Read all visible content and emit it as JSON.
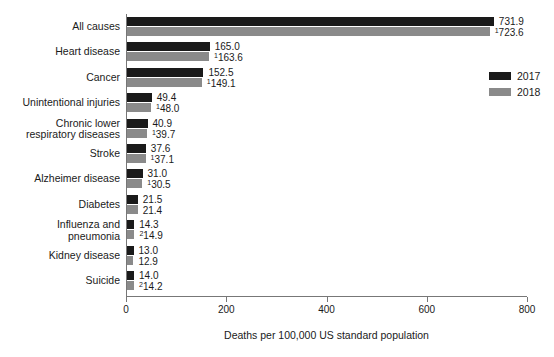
{
  "chart_data": {
    "type": "bar",
    "orientation": "horizontal",
    "title": "",
    "xlabel": "Deaths per 100,000 US standard population",
    "ylabel": "",
    "xlim": [
      0,
      800
    ],
    "xticks": [
      0,
      200,
      400,
      600,
      800
    ],
    "xtick_labels": [
      "0",
      "200",
      "400",
      "600",
      "800"
    ],
    "grid": false,
    "legend_position": "upper right",
    "categories": [
      "All causes",
      "Heart disease",
      "Cancer",
      "Unintentional injuries",
      "Chronic lower\nrespiratory diseases",
      "Stroke",
      "Alzheimer disease",
      "Diabetes",
      "Influenza and\npneumonia",
      "Kidney disease",
      "Suicide"
    ],
    "series": [
      {
        "name": "2017",
        "color": "#1a1a1a",
        "values": [
          731.9,
          165.0,
          152.5,
          49.4,
          40.9,
          37.6,
          31.0,
          21.5,
          14.3,
          13.0,
          14.0
        ],
        "labels": [
          "731.9",
          "165.0",
          "152.5",
          "49.4",
          "40.9",
          "37.6",
          "31.0",
          "21.5",
          "14.3",
          "13.0",
          "14.0"
        ],
        "footnotes": [
          "",
          "",
          "",
          "",
          "",
          "",
          "",
          "",
          "",
          "",
          ""
        ]
      },
      {
        "name": "2018",
        "color": "#8a8a8a",
        "values": [
          723.6,
          163.6,
          149.1,
          48.0,
          39.7,
          37.1,
          30.5,
          21.4,
          14.9,
          12.9,
          14.2
        ],
        "labels": [
          "723.6",
          "163.6",
          "149.1",
          "48.0",
          "39.7",
          "37.1",
          "30.5",
          "21.4",
          "14.9",
          "12.9",
          "14.2"
        ],
        "footnotes": [
          "1",
          "1",
          "1",
          "1",
          "1",
          "1",
          "1",
          "",
          "2",
          "",
          "2"
        ]
      }
    ]
  },
  "legend": {
    "entries": [
      {
        "label": "2017",
        "color": "#1a1a1a"
      },
      {
        "label": "2018",
        "color": "#8a8a8a"
      }
    ]
  }
}
